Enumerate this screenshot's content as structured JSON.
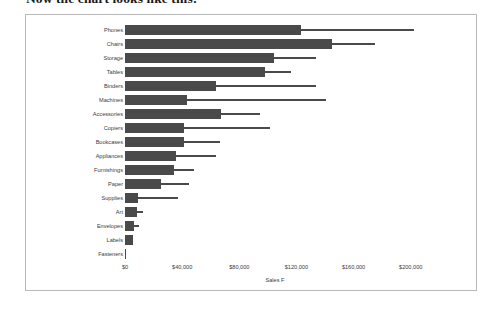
{
  "page": {
    "heading": "Now the chart looks like this:"
  },
  "chart_data": {
    "type": "bar",
    "orientation": "horizontal",
    "title": "",
    "xlabel": "Sales F",
    "ylabel": "",
    "xlim": [
      0,
      210000
    ],
    "grid": false,
    "legend_position": "none",
    "bar_color": "#4a4a4a",
    "axis_tick_labels": [
      "$0",
      "$40,000",
      "$80,000",
      "$120,000",
      "$160,000",
      "$200,000"
    ],
    "axis_tick_values": [
      0,
      40000,
      80000,
      120000,
      160000,
      200000
    ],
    "categories": [
      "Phones",
      "Chairs",
      "Storage",
      "Tables",
      "Binders",
      "Machines",
      "Accessories",
      "Copiers",
      "Bookcases",
      "Appliances",
      "Furnishings",
      "Paper",
      "Supplies",
      "Art",
      "Envelopes",
      "Labels",
      "Fasteners"
    ],
    "series": [
      {
        "name": "Sales",
        "style": "thick-bar",
        "values": [
          123500,
          145000,
          104000,
          98000,
          64000,
          43500,
          67500,
          41500,
          41500,
          35500,
          34500,
          25500,
          9000,
          8500,
          6500,
          5500,
          1000
        ]
      },
      {
        "name": "Reference",
        "style": "thin-bar",
        "values": [
          202000,
          175000,
          133500,
          116000,
          133500,
          141000,
          94500,
          101500,
          66500,
          64000,
          48500,
          45000,
          37000,
          12500,
          9500,
          5500,
          1000
        ]
      }
    ],
    "rows": [
      {
        "category": "Phones",
        "sales": 123500,
        "reference": 202000
      },
      {
        "category": "Chairs",
        "sales": 145000,
        "reference": 175000
      },
      {
        "category": "Storage",
        "sales": 104000,
        "reference": 133500
      },
      {
        "category": "Tables",
        "sales": 98000,
        "reference": 116000
      },
      {
        "category": "Binders",
        "sales": 64000,
        "reference": 133500
      },
      {
        "category": "Machines",
        "sales": 43500,
        "reference": 141000
      },
      {
        "category": "Accessories",
        "sales": 67500,
        "reference": 94500
      },
      {
        "category": "Copiers",
        "sales": 41500,
        "reference": 101500
      },
      {
        "category": "Bookcases",
        "sales": 41500,
        "reference": 66500
      },
      {
        "category": "Appliances",
        "sales": 35500,
        "reference": 64000
      },
      {
        "category": "Furnishings",
        "sales": 34500,
        "reference": 48500
      },
      {
        "category": "Paper",
        "sales": 25500,
        "reference": 45000
      },
      {
        "category": "Supplies",
        "sales": 9000,
        "reference": 37000
      },
      {
        "category": "Art",
        "sales": 8500,
        "reference": 12500
      },
      {
        "category": "Envelopes",
        "sales": 6500,
        "reference": 9500
      },
      {
        "category": "Labels",
        "sales": 5500,
        "reference": 5500
      },
      {
        "category": "Fasteners",
        "sales": 1000,
        "reference": 1000
      }
    ]
  }
}
